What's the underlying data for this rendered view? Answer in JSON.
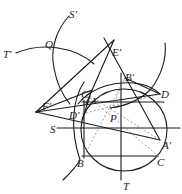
{
  "figure": {
    "type": "geometric-construction",
    "stroke_color": "#1a1a1a",
    "dashed_color": "#777777",
    "background": "#ffffff"
  },
  "labels": {
    "S_prime": "S'",
    "T_prime": "T'",
    "Q": "Q",
    "E_prime": "E'",
    "B_prime": "B'",
    "C_prime": "C'",
    "A": "A",
    "D": "D",
    "F_prime": "F'",
    "D_prime": "D'",
    "S": "S",
    "P": "P",
    "A_prime": "A'",
    "B": "B",
    "C": "C",
    "T": "T"
  }
}
